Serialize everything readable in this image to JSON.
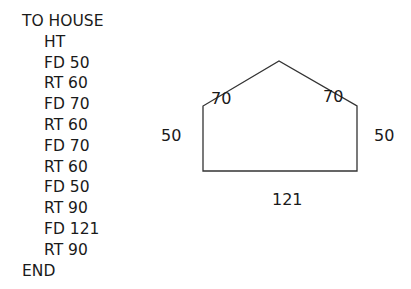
{
  "procedure": {
    "header": "TO HOUSE",
    "commands": [
      "HT",
      "FD 50",
      "RT 60",
      "FD 70",
      "RT 60",
      "FD 70",
      "RT 60",
      "FD 50",
      "RT 90",
      "FD 121",
      "RT 90"
    ],
    "footer": "END"
  },
  "diagram": {
    "labels": {
      "left_roof": "70",
      "right_roof": "70",
      "left_wall": "50",
      "right_wall": "50",
      "base": "121"
    },
    "stroke_color": "#333333"
  }
}
